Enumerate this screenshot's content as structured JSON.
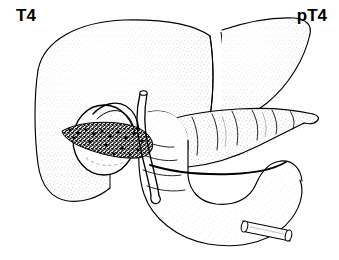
{
  "figure": {
    "kind": "anatomical-line-drawing",
    "background_color": "#ffffff",
    "ink_color": "#000000",
    "stipple_color": "#808080",
    "tumor_color": "#1a1a1a",
    "width": 339,
    "height": 260
  },
  "labels": {
    "left": "T4",
    "right": "pT4"
  },
  "structures": {
    "liver_right_lobe": "liver-right-lobe",
    "liver_left_lobe": "liver-left-lobe",
    "falciform_ligament": "falciform-ligament",
    "gallbladder": "gallbladder",
    "cystic_duct": "cystic-duct",
    "common_bile_duct": "common-bile-duct",
    "hepatic_duct_stump": "hepatic-duct-stump",
    "bile_duct_cut_end": "bile-duct-cut-end",
    "pancreas_head": "pancreas-head",
    "pancreas_body_tail": "pancreas-body-tail",
    "duodenum": "duodenum",
    "jejunum_stump": "jejunum-stump",
    "tumor_mass": "tumor-mass"
  }
}
